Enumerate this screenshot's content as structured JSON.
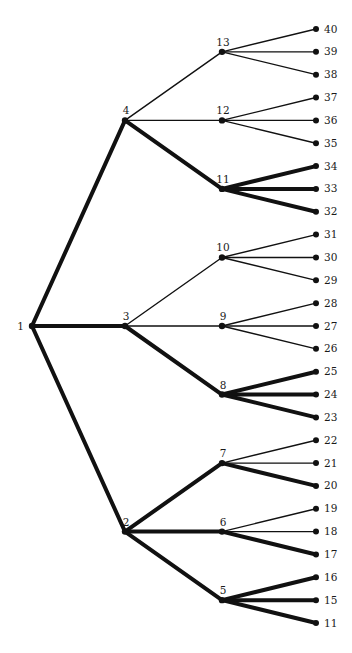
{
  "diagram": {
    "type": "tree",
    "colors": {
      "edge": "#111111",
      "node": "#111111",
      "background": "#ffffff"
    },
    "nodes": [
      {
        "id": "1",
        "label": "1",
        "level": 0
      },
      {
        "id": "4",
        "label": "4",
        "level": 1
      },
      {
        "id": "3",
        "label": "3",
        "level": 1
      },
      {
        "id": "2",
        "label": "2",
        "level": 1
      },
      {
        "id": "13",
        "label": "13",
        "level": 2
      },
      {
        "id": "12",
        "label": "12",
        "level": 2
      },
      {
        "id": "11",
        "label": "11",
        "level": 2
      },
      {
        "id": "10",
        "label": "10",
        "level": 2
      },
      {
        "id": "9",
        "label": "9",
        "level": 2
      },
      {
        "id": "8",
        "label": "8",
        "level": 2
      },
      {
        "id": "7",
        "label": "7",
        "level": 2
      },
      {
        "id": "6",
        "label": "6",
        "level": 2
      },
      {
        "id": "5",
        "label": "5",
        "level": 2
      },
      {
        "id": "40",
        "label": "40",
        "level": 3
      },
      {
        "id": "39",
        "label": "39",
        "level": 3
      },
      {
        "id": "38",
        "label": "38",
        "level": 3
      },
      {
        "id": "37",
        "label": "37",
        "level": 3
      },
      {
        "id": "36",
        "label": "36",
        "level": 3
      },
      {
        "id": "35",
        "label": "35",
        "level": 3
      },
      {
        "id": "34",
        "label": "34",
        "level": 3
      },
      {
        "id": "33",
        "label": "33",
        "level": 3
      },
      {
        "id": "32",
        "label": "32",
        "level": 3
      },
      {
        "id": "31",
        "label": "31",
        "level": 3
      },
      {
        "id": "30",
        "label": "30",
        "level": 3
      },
      {
        "id": "29",
        "label": "29",
        "level": 3
      },
      {
        "id": "28",
        "label": "28",
        "level": 3
      },
      {
        "id": "27",
        "label": "27",
        "level": 3
      },
      {
        "id": "26",
        "label": "26",
        "level": 3
      },
      {
        "id": "25",
        "label": "25",
        "level": 3
      },
      {
        "id": "24",
        "label": "24",
        "level": 3
      },
      {
        "id": "23",
        "label": "23",
        "level": 3
      },
      {
        "id": "22",
        "label": "22",
        "level": 3
      },
      {
        "id": "21",
        "label": "21",
        "level": 3
      },
      {
        "id": "20",
        "label": "20",
        "level": 3
      },
      {
        "id": "19",
        "label": "19",
        "level": 3
      },
      {
        "id": "18",
        "label": "18",
        "level": 3
      },
      {
        "id": "17",
        "label": "17",
        "level": 3
      },
      {
        "id": "16",
        "label": "16",
        "level": 3
      },
      {
        "id": "15",
        "label": "15",
        "level": 3
      },
      {
        "id": "14",
        "label": "11",
        "level": 3
      }
    ],
    "edges": [
      {
        "from": "1",
        "to": "4",
        "weight": "heavy"
      },
      {
        "from": "1",
        "to": "3",
        "weight": "heavy"
      },
      {
        "from": "1",
        "to": "2",
        "weight": "heavy"
      },
      {
        "from": "4",
        "to": "13",
        "weight": "light"
      },
      {
        "from": "4",
        "to": "12",
        "weight": "light"
      },
      {
        "from": "4",
        "to": "11",
        "weight": "heavy"
      },
      {
        "from": "3",
        "to": "10",
        "weight": "light"
      },
      {
        "from": "3",
        "to": "9",
        "weight": "light"
      },
      {
        "from": "3",
        "to": "8",
        "weight": "heavy"
      },
      {
        "from": "2",
        "to": "7",
        "weight": "heavy"
      },
      {
        "from": "2",
        "to": "6",
        "weight": "heavy"
      },
      {
        "from": "2",
        "to": "5",
        "weight": "heavy"
      },
      {
        "from": "13",
        "to": "40",
        "weight": "light"
      },
      {
        "from": "13",
        "to": "39",
        "weight": "light"
      },
      {
        "from": "13",
        "to": "38",
        "weight": "light"
      },
      {
        "from": "12",
        "to": "37",
        "weight": "light"
      },
      {
        "from": "12",
        "to": "36",
        "weight": "light"
      },
      {
        "from": "12",
        "to": "35",
        "weight": "light"
      },
      {
        "from": "11",
        "to": "34",
        "weight": "heavy"
      },
      {
        "from": "11",
        "to": "33",
        "weight": "heavy"
      },
      {
        "from": "11",
        "to": "32",
        "weight": "heavy"
      },
      {
        "from": "10",
        "to": "31",
        "weight": "light"
      },
      {
        "from": "10",
        "to": "30",
        "weight": "light"
      },
      {
        "from": "10",
        "to": "29",
        "weight": "light"
      },
      {
        "from": "9",
        "to": "28",
        "weight": "light"
      },
      {
        "from": "9",
        "to": "27",
        "weight": "light"
      },
      {
        "from": "9",
        "to": "26",
        "weight": "light"
      },
      {
        "from": "8",
        "to": "25",
        "weight": "heavy"
      },
      {
        "from": "8",
        "to": "24",
        "weight": "heavy"
      },
      {
        "from": "8",
        "to": "23",
        "weight": "heavy"
      },
      {
        "from": "7",
        "to": "22",
        "weight": "light"
      },
      {
        "from": "7",
        "to": "21",
        "weight": "light"
      },
      {
        "from": "7",
        "to": "20",
        "weight": "heavy"
      },
      {
        "from": "6",
        "to": "19",
        "weight": "light"
      },
      {
        "from": "6",
        "to": "18",
        "weight": "light"
      },
      {
        "from": "6",
        "to": "17",
        "weight": "heavy"
      },
      {
        "from": "5",
        "to": "16",
        "weight": "heavy"
      },
      {
        "from": "5",
        "to": "15",
        "weight": "heavy"
      },
      {
        "from": "5",
        "to": "14",
        "weight": "heavy"
      }
    ]
  }
}
